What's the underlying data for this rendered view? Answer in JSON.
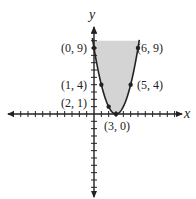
{
  "chart_data": {
    "type": "line",
    "title": "",
    "equation": "y = (x - 3)^2",
    "xlabel": "x",
    "ylabel": "y",
    "xlim": [
      -11.5,
      11.5
    ],
    "ylim": [
      -11,
      11.5
    ],
    "grid": false,
    "legend": null,
    "shaded_region": {
      "description": "region inside parabola above the curve",
      "color": "#d4d4d4",
      "y_top": 10
    },
    "series": [
      {
        "name": "parabola",
        "x": [
          0,
          1,
          2,
          3,
          5,
          6
        ],
        "y": [
          9,
          4,
          1,
          0,
          4,
          9
        ]
      }
    ],
    "points": [
      {
        "x": 0,
        "y": 9,
        "label": "(0, 9)"
      },
      {
        "x": 1,
        "y": 4,
        "label": "(1, 4)"
      },
      {
        "x": 2,
        "y": 1,
        "label": "(2, 1)"
      },
      {
        "x": 3,
        "y": 0,
        "label": "(3, 0)"
      },
      {
        "x": 5,
        "y": 4,
        "label": "(5, 4)"
      },
      {
        "x": 6,
        "y": 9,
        "label": "(6, 9)"
      }
    ]
  },
  "labels": {
    "x_axis": "x",
    "y_axis": "y",
    "p09": "(0, 9)",
    "p14": "(1, 4)",
    "p21": "(2, 1)",
    "p30": "(3, 0)",
    "p54": "(5, 4)",
    "p69": "(6, 9)"
  },
  "colors": {
    "shade": "#d4d4d4",
    "ink": "#222222"
  }
}
